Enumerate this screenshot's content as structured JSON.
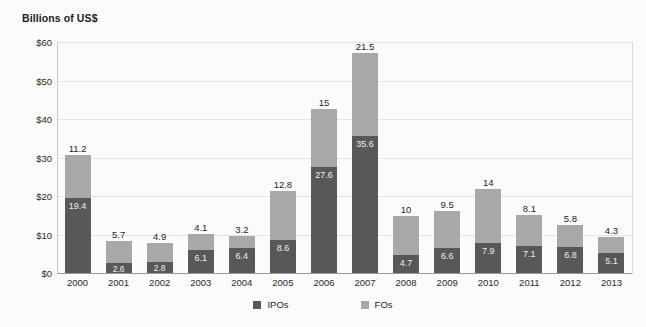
{
  "chart_data": {
    "type": "bar",
    "title": "Billions of US$",
    "subtitle": "",
    "xlabel": "",
    "ylabel": "Billions of US$",
    "stacked": true,
    "grid": true,
    "legend_position": "bottom",
    "ylim": [
      0,
      60
    ],
    "ytick_labels": [
      "$60",
      "$50",
      "$40",
      "$30",
      "$20",
      "$10",
      "$0"
    ],
    "ytick_values": [
      60,
      50,
      40,
      30,
      20,
      10,
      0
    ],
    "categories": [
      "2000",
      "2001",
      "2002",
      "2003",
      "2004",
      "2005",
      "2006",
      "2007",
      "2008",
      "2009",
      "2010",
      "2011",
      "2012",
      "2013"
    ],
    "series": [
      {
        "name": "IPOs",
        "color": "#585858",
        "values": [
          19.4,
          2.6,
          2.8,
          6.1,
          6.4,
          8.6,
          27.6,
          35.6,
          4.7,
          6.6,
          7.9,
          7.1,
          6.8,
          5.1
        ],
        "labels": [
          "19.4",
          "2.6",
          "2.8",
          "6.1",
          "6.4",
          "8.6",
          "27.6",
          "35.6",
          "4.7",
          "6.6",
          "7.9",
          "7.1",
          "6.8",
          "5.1"
        ]
      },
      {
        "name": "FOs",
        "color": "#a8a8a8",
        "values": [
          11.2,
          5.7,
          4.9,
          4.1,
          3.2,
          12.8,
          15,
          21.5,
          10,
          9.5,
          14,
          8.1,
          5.8,
          4.3
        ],
        "labels": [
          "11.2",
          "5.7",
          "4.9",
          "4.1",
          "3.2",
          "12.8",
          "15",
          "21.5",
          "10",
          "9.5",
          "14",
          "8.1",
          "5.8",
          "4.3"
        ]
      }
    ],
    "totals": [
      30.6,
      8.3,
      7.7,
      10.2,
      9.6,
      21.4,
      42.6,
      57.1,
      14.7,
      16.1,
      21.9,
      15.2,
      12.6,
      9.4
    ]
  },
  "legend": {
    "items": [
      {
        "label": "IPOs",
        "color": "#585858"
      },
      {
        "label": "FOs",
        "color": "#a8a8a8"
      }
    ]
  }
}
